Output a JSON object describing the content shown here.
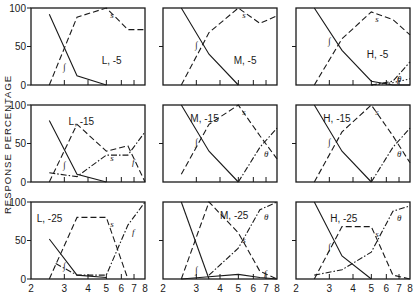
{
  "figure": {
    "ylabel": "RESPONSE PERCENTAGE",
    "y_ticks": [
      "0",
      "50",
      "100"
    ],
    "x_ticks": [
      "2",
      "3",
      "4",
      "5",
      "6",
      "7",
      "8"
    ]
  },
  "chart_data": [
    {
      "type": "line",
      "title": "L, -5",
      "row": 0,
      "col": 0,
      "xlim": [
        2,
        8
      ],
      "ylim": [
        0,
        100
      ],
      "xscale": "log",
      "series": [
        {
          "name": "∫",
          "style": "solid",
          "x": [
            2.5,
            3.5,
            5
          ],
          "y": [
            92,
            12,
            0
          ]
        },
        {
          "name": "s",
          "style": "dash",
          "x": [
            2.5,
            3.5,
            5,
            6.5,
            8
          ],
          "y": [
            0,
            88,
            100,
            72,
            72
          ]
        }
      ]
    },
    {
      "type": "line",
      "title": "M, -5",
      "row": 0,
      "col": 1,
      "xlim": [
        2,
        8
      ],
      "ylim": [
        0,
        100
      ],
      "xscale": "log",
      "series": [
        {
          "name": "∫",
          "style": "solid",
          "x": [
            2.5,
            3.5,
            5
          ],
          "y": [
            100,
            40,
            0
          ]
        },
        {
          "name": "s",
          "style": "dash",
          "x": [
            2.5,
            3.5,
            5,
            6.5,
            8
          ],
          "y": [
            0,
            68,
            100,
            80,
            90
          ]
        }
      ]
    },
    {
      "type": "line",
      "title": "H, -5",
      "row": 0,
      "col": 2,
      "xlim": [
        2,
        8
      ],
      "ylim": [
        0,
        100
      ],
      "xscale": "log",
      "series": [
        {
          "name": "∫",
          "style": "solid",
          "x": [
            2.5,
            3.5,
            5,
            6.5,
            8
          ],
          "y": [
            100,
            45,
            5,
            0,
            0
          ]
        },
        {
          "name": "s",
          "style": "dash",
          "x": [
            2.5,
            3.5,
            5,
            6.5,
            8
          ],
          "y": [
            0,
            60,
            95,
            85,
            65
          ]
        },
        {
          "name": "θ",
          "style": "dashdot",
          "x": [
            5,
            6.5,
            8
          ],
          "y": [
            0,
            5,
            30
          ]
        },
        {
          "name": "f",
          "style": "dot",
          "x": [
            5,
            6.5,
            8
          ],
          "y": [
            0,
            3,
            8
          ]
        }
      ]
    },
    {
      "type": "line",
      "title": "L, -15",
      "row": 1,
      "col": 0,
      "xlim": [
        2,
        8
      ],
      "ylim": [
        0,
        100
      ],
      "xscale": "log",
      "series": [
        {
          "name": "∫",
          "style": "solid",
          "x": [
            2.5,
            3.5,
            5
          ],
          "y": [
            80,
            10,
            0
          ]
        },
        {
          "name": "s",
          "style": "dash",
          "x": [
            2.5,
            3.5,
            5,
            6.5,
            8
          ],
          "y": [
            0,
            75,
            40,
            47,
            0
          ]
        },
        {
          "name": "f",
          "style": "dashdot",
          "x": [
            2.5,
            3.5,
            5,
            6.5,
            8
          ],
          "y": [
            12,
            7,
            35,
            35,
            65
          ]
        }
      ]
    },
    {
      "type": "line",
      "title": "M, -15",
      "row": 1,
      "col": 1,
      "xlim": [
        2,
        8
      ],
      "ylim": [
        0,
        100
      ],
      "xscale": "log",
      "series": [
        {
          "name": "∫",
          "style": "solid",
          "x": [
            2.5,
            3.5,
            5
          ],
          "y": [
            100,
            40,
            0
          ]
        },
        {
          "name": "s",
          "style": "dash",
          "x": [
            2.5,
            3.5,
            5,
            6.5,
            8
          ],
          "y": [
            10,
            75,
            100,
            60,
            30
          ]
        },
        {
          "name": "θ",
          "style": "dashdot",
          "x": [
            5,
            6.5,
            8
          ],
          "y": [
            0,
            45,
            70
          ]
        }
      ]
    },
    {
      "type": "line",
      "title": "H, -15",
      "row": 1,
      "col": 2,
      "xlim": [
        2,
        8
      ],
      "ylim": [
        0,
        100
      ],
      "xscale": "log",
      "series": [
        {
          "name": "∫",
          "style": "solid",
          "x": [
            2.5,
            3.5,
            5
          ],
          "y": [
            100,
            40,
            0
          ]
        },
        {
          "name": "s",
          "style": "dash",
          "x": [
            2.5,
            3.5,
            5,
            6.5,
            8
          ],
          "y": [
            0,
            65,
            100,
            60,
            25
          ]
        },
        {
          "name": "θ",
          "style": "dashdot",
          "x": [
            5,
            6.5,
            8
          ],
          "y": [
            0,
            45,
            70
          ]
        }
      ]
    },
    {
      "type": "line",
      "title": "L, -25",
      "row": 2,
      "col": 0,
      "xlim": [
        2,
        8
      ],
      "ylim": [
        0,
        100
      ],
      "xscale": "log",
      "series": [
        {
          "name": "∫",
          "style": "solid",
          "x": [
            2.5,
            3.5,
            5
          ],
          "y": [
            52,
            5,
            2
          ]
        },
        {
          "name": "s",
          "style": "dash",
          "x": [
            2.5,
            3.5,
            5,
            6.5
          ],
          "y": [
            0,
            80,
            80,
            0
          ]
        },
        {
          "name": "f",
          "style": "dashdot",
          "x": [
            2.7,
            3.5,
            5,
            6.5,
            8
          ],
          "y": [
            20,
            5,
            5,
            70,
            100
          ]
        }
      ]
    },
    {
      "type": "line",
      "title": "M, -25",
      "row": 2,
      "col": 1,
      "xlim": [
        2,
        8
      ],
      "ylim": [
        0,
        100
      ],
      "xscale": "log",
      "series": [
        {
          "name": "∫",
          "style": "solid",
          "x": [
            2.5,
            3.5
          ],
          "y": [
            100,
            0
          ]
        },
        {
          "name": "s",
          "style": "dash",
          "x": [
            2.5,
            3.5,
            5,
            6.5,
            8
          ],
          "y": [
            0,
            100,
            60,
            10,
            0
          ]
        },
        {
          "name": "θ",
          "style": "dashdot",
          "x": [
            3.5,
            5,
            6.5,
            8
          ],
          "y": [
            5,
            40,
            90,
            100
          ]
        },
        {
          "name": "f",
          "style": "solid",
          "x": [
            2.5,
            3.5,
            5,
            6.5,
            8
          ],
          "y": [
            0,
            3,
            6,
            2,
            0
          ]
        }
      ]
    },
    {
      "type": "line",
      "title": "H, -25",
      "row": 2,
      "col": 2,
      "xlim": [
        2,
        8
      ],
      "ylim": [
        0,
        100
      ],
      "xscale": "log",
      "series": [
        {
          "name": "∫",
          "style": "solid",
          "x": [
            2.5,
            3.5,
            5
          ],
          "y": [
            100,
            30,
            0
          ]
        },
        {
          "name": "s",
          "style": "dash",
          "x": [
            2.5,
            3.5,
            5,
            6.5,
            8
          ],
          "y": [
            0,
            68,
            68,
            5,
            0
          ]
        },
        {
          "name": "θ",
          "style": "dashdot",
          "x": [
            2.5,
            3.5,
            5,
            6.5,
            8
          ],
          "y": [
            5,
            12,
            35,
            88,
            95
          ]
        }
      ]
    }
  ]
}
